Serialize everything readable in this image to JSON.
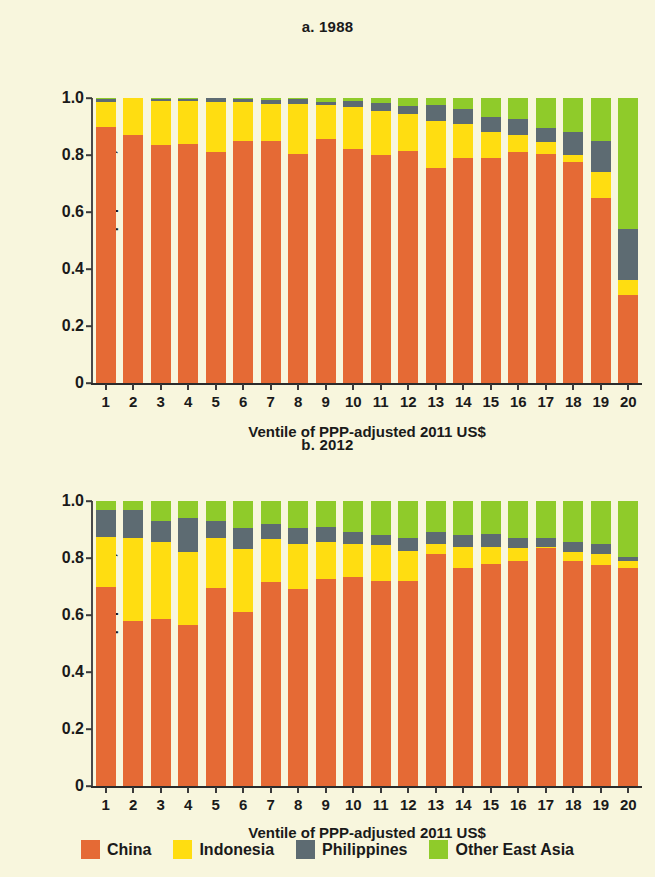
{
  "figure": {
    "background_color": "#f8f6dd",
    "ylabel": "Share of ventile population, %",
    "xlabel": "Ventile of PPP-adjusted 2011 US$",
    "ytick_labels": [
      "0",
      "0.2",
      "0.4",
      "0.6",
      "0.8",
      "1.0"
    ],
    "ytick_values": [
      0,
      0.2,
      0.4,
      0.6,
      0.8,
      1.0
    ],
    "xtick_labels": [
      "1",
      "2",
      "3",
      "4",
      "5",
      "6",
      "7",
      "8",
      "9",
      "10",
      "11",
      "12",
      "13",
      "14",
      "15",
      "16",
      "17",
      "18",
      "19",
      "20"
    ]
  },
  "legend": {
    "position": "bottom-center",
    "items": [
      {
        "label": "China",
        "color": "#e56a35"
      },
      {
        "label": "Indonesia",
        "color": "#ffdd11"
      },
      {
        "label": "Philippines",
        "color": "#5d6b72"
      },
      {
        "label": "Other East Asia",
        "color": "#8fcb2a"
      }
    ]
  },
  "chart_data": [
    {
      "type": "bar",
      "stacked": true,
      "normalized": true,
      "title": "a. 1988",
      "xlabel": "Ventile of PPP-adjusted 2011 US$",
      "ylabel": "Share of ventile population, %",
      "ylim": [
        0,
        1.0
      ],
      "grid": false,
      "legend": "bottom",
      "categories": [
        "1",
        "2",
        "3",
        "4",
        "5",
        "6",
        "7",
        "8",
        "9",
        "10",
        "11",
        "12",
        "13",
        "14",
        "15",
        "16",
        "17",
        "18",
        "19",
        "20"
      ],
      "series": [
        {
          "name": "China",
          "color": "#e56a35",
          "values": [
            0.9,
            0.87,
            0.835,
            0.84,
            0.81,
            0.85,
            0.85,
            0.805,
            0.855,
            0.82,
            0.8,
            0.815,
            0.755,
            0.79,
            0.79,
            0.81,
            0.805,
            0.775,
            0.65,
            0.31
          ]
        },
        {
          "name": "Indonesia",
          "color": "#ffdd11",
          "values": [
            0.085,
            0.13,
            0.155,
            0.15,
            0.175,
            0.135,
            0.13,
            0.175,
            0.12,
            0.15,
            0.155,
            0.13,
            0.165,
            0.12,
            0.09,
            0.06,
            0.04,
            0.025,
            0.09,
            0.05
          ]
        },
        {
          "name": "Philippines",
          "color": "#5d6b72",
          "values": [
            0.012,
            0.0,
            0.008,
            0.008,
            0.015,
            0.013,
            0.013,
            0.017,
            0.012,
            0.02,
            0.029,
            0.028,
            0.055,
            0.05,
            0.055,
            0.055,
            0.05,
            0.08,
            0.11,
            0.18
          ]
        },
        {
          "name": "Other East Asia",
          "color": "#8fcb2a",
          "values": [
            0.003,
            0.0,
            0.002,
            0.002,
            0.0,
            0.002,
            0.007,
            0.003,
            0.013,
            0.01,
            0.016,
            0.027,
            0.025,
            0.04,
            0.065,
            0.075,
            0.105,
            0.12,
            0.15,
            0.46
          ]
        }
      ]
    },
    {
      "type": "bar",
      "stacked": true,
      "normalized": true,
      "title": "b. 2012",
      "xlabel": "Ventile of PPP-adjusted 2011 US$",
      "ylabel": "Share of ventile population, %",
      "ylim": [
        0,
        1.0
      ],
      "grid": false,
      "legend": "bottom",
      "categories": [
        "1",
        "2",
        "3",
        "4",
        "5",
        "6",
        "7",
        "8",
        "9",
        "10",
        "11",
        "12",
        "13",
        "14",
        "15",
        "16",
        "17",
        "18",
        "19",
        "20"
      ],
      "series": [
        {
          "name": "China",
          "color": "#e56a35",
          "values": [
            0.7,
            0.58,
            0.585,
            0.565,
            0.695,
            0.61,
            0.715,
            0.69,
            0.725,
            0.735,
            0.72,
            0.72,
            0.815,
            0.765,
            0.78,
            0.79,
            0.835,
            0.79,
            0.775,
            0.765
          ]
        },
        {
          "name": "Indonesia",
          "color": "#ffdd11",
          "values": [
            0.175,
            0.29,
            0.27,
            0.255,
            0.175,
            0.22,
            0.15,
            0.16,
            0.13,
            0.115,
            0.125,
            0.105,
            0.035,
            0.075,
            0.06,
            0.045,
            0.005,
            0.03,
            0.04,
            0.025
          ]
        },
        {
          "name": "Philippines",
          "color": "#5d6b72",
          "values": [
            0.095,
            0.1,
            0.075,
            0.12,
            0.06,
            0.075,
            0.055,
            0.055,
            0.055,
            0.04,
            0.035,
            0.045,
            0.04,
            0.04,
            0.045,
            0.035,
            0.03,
            0.035,
            0.035,
            0.015
          ]
        },
        {
          "name": "Other East Asia",
          "color": "#8fcb2a",
          "values": [
            0.03,
            0.03,
            0.07,
            0.06,
            0.07,
            0.095,
            0.08,
            0.095,
            0.09,
            0.11,
            0.12,
            0.13,
            0.11,
            0.12,
            0.115,
            0.13,
            0.13,
            0.145,
            0.15,
            0.195
          ]
        }
      ]
    }
  ]
}
